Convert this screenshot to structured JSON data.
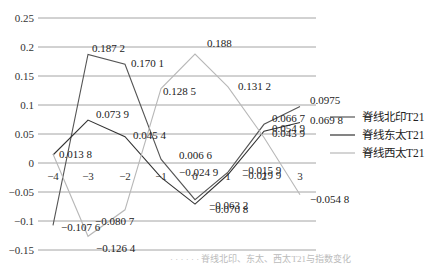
{
  "chart_data": {
    "type": "line",
    "title": "",
    "xlabel": "",
    "ylabel": "",
    "x": [
      -4,
      -3,
      -2,
      -1,
      0,
      1,
      2,
      3
    ],
    "x_tick_labels": [
      "−4",
      "−3",
      "−2",
      "−1",
      "0",
      "1",
      "2",
      "3"
    ],
    "y_ticks": [
      0.25,
      0.2,
      0.15,
      0.1,
      0.05,
      0,
      -0.05,
      -0.1,
      -0.15
    ],
    "y_tick_labels": [
      "0.25",
      "0.2",
      "0.15",
      "0.1",
      "0.05",
      "0",
      "−0.05",
      "−0.1",
      "−0.15"
    ],
    "ylim": [
      -0.15,
      0.25
    ],
    "grid": true,
    "legend_position": "right",
    "series": [
      {
        "name": "脊线北印T21",
        "color": "#555555",
        "values": [
          -0.1076,
          0.1872,
          0.1701,
          0.0066,
          -0.0632,
          -0.0159,
          0.0667,
          0.0975
        ],
        "labels": [
          "−0.107 6",
          "0.187 2",
          "0.170 1",
          "0.006 6",
          "−0.063 2",
          "−0.015 9",
          "0.066 7",
          "0.0975"
        ]
      },
      {
        "name": "脊线东太T21",
        "color": "#333333",
        "values": [
          0.0138,
          0.0739,
          0.0454,
          -0.0249,
          -0.0708,
          -0.0199,
          0.0549,
          0.0698
        ],
        "labels": [
          "0.013 8",
          "0.073 9",
          "0.045 4",
          "−0.024 9",
          "−0.070 8",
          "−0.019 9",
          "0.054 9",
          "0.069 8"
        ]
      },
      {
        "name": "脊线西太T21",
        "color": "#b8b8b8",
        "values": [
          0.0155,
          -0.1264,
          -0.0807,
          0.1285,
          0.188,
          0.1312,
          0.0439,
          -0.0548
        ],
        "labels": [
          "",
          "−0.126 4",
          "−0.080 7",
          "0.128 5",
          "0.188",
          "0.131 2",
          "0.043 9",
          "−0.054 8"
        ]
      }
    ]
  },
  "caption": "· · · · · · 脊线北印、东太、西太T21与指数变化"
}
